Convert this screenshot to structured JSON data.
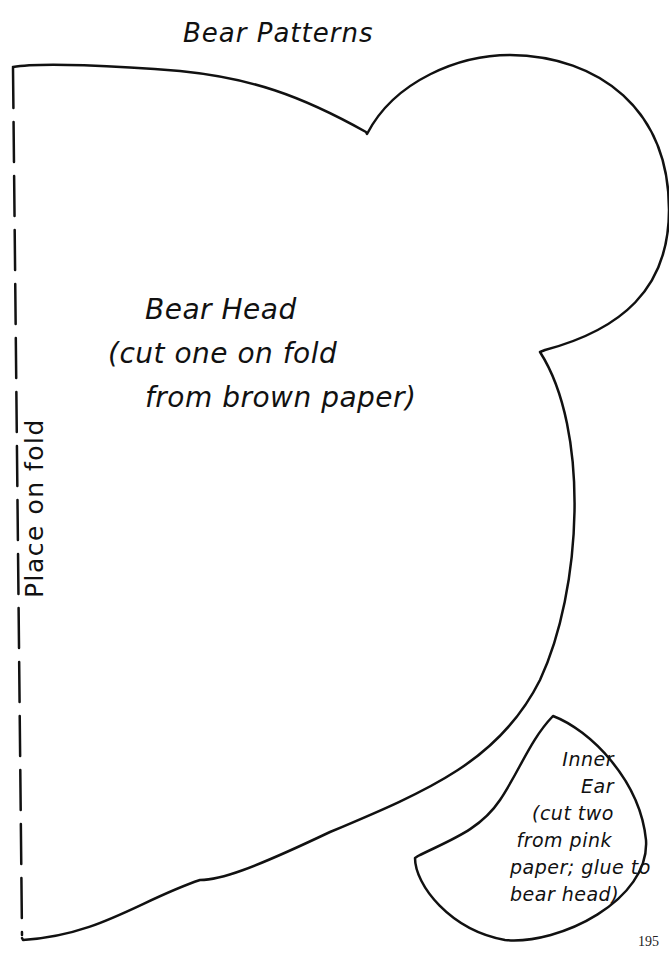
{
  "page": {
    "title": "Bear Patterns",
    "page_number": "195"
  },
  "bear_head": {
    "line1": "Bear Head",
    "line2": "(cut one on fold",
    "line3": "from brown paper)"
  },
  "fold_instruction": "Place on fold",
  "inner_ear": {
    "line1": "Inner",
    "line2": "Ear",
    "line3": "(cut two",
    "line4": "from pink",
    "line5": "paper; glue to",
    "line6": "bear head)"
  },
  "colors": {
    "line": "#111111",
    "background": "#ffffff"
  }
}
